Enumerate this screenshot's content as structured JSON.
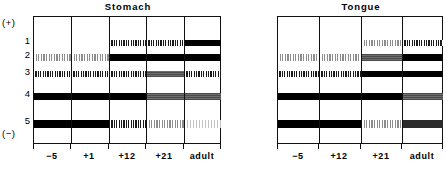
{
  "figure": {
    "type": "zymogram",
    "axis_top_label": "(+)",
    "axis_bottom_label": "(−)",
    "band_row_labels": [
      "1",
      "2",
      "3",
      "4",
      "5"
    ]
  },
  "panels": [
    {
      "title": "Stomach",
      "lane_labels": [
        "−5",
        "+1",
        "+12",
        "+21",
        "adult"
      ]
    },
    {
      "title": "Tongue",
      "lane_labels": [
        "−5",
        "+12",
        "+21",
        "adult"
      ]
    }
  ],
  "chart_data": {
    "type": "heatmap",
    "xlabel": "",
    "ylabel": "",
    "rows": [
      "1",
      "2",
      "3",
      "4",
      "5"
    ],
    "intensity_scale": [
      "none",
      "vfaint",
      "faint",
      "dot",
      "gray",
      "dark",
      "solid"
    ],
    "panels": [
      {
        "name": "Stomach",
        "categories": [
          "−5",
          "+1",
          "+12",
          "+21",
          "adult"
        ],
        "series": [
          {
            "name": "1",
            "values": [
              "none",
              "none",
              "dot",
              "dot",
              "solid"
            ]
          },
          {
            "name": "2",
            "values": [
              "faint",
              "faint",
              "solid",
              "solid",
              "solid"
            ]
          },
          {
            "name": "3",
            "values": [
              "dot",
              "dot",
              "dot",
              "gray",
              "dot"
            ]
          },
          {
            "name": "4",
            "values": [
              "solid",
              "solid",
              "solid",
              "gray",
              "gray"
            ]
          },
          {
            "name": "5",
            "values": [
              "solid",
              "solid",
              "dot",
              "faint",
              "vfaint"
            ]
          }
        ]
      },
      {
        "name": "Tongue",
        "categories": [
          "−5",
          "+12",
          "+21",
          "adult"
        ],
        "series": [
          {
            "name": "1",
            "values": [
              "none",
              "none",
              "faint",
              "dot"
            ]
          },
          {
            "name": "2",
            "values": [
              "faint",
              "faint",
              "gray",
              "solid"
            ]
          },
          {
            "name": "3",
            "values": [
              "dot",
              "dot",
              "solid",
              "solid"
            ]
          },
          {
            "name": "4",
            "values": [
              "solid",
              "solid",
              "solid",
              "gray"
            ]
          },
          {
            "name": "5",
            "values": [
              "solid",
              "solid",
              "faint",
              "dark"
            ]
          }
        ]
      }
    ]
  }
}
